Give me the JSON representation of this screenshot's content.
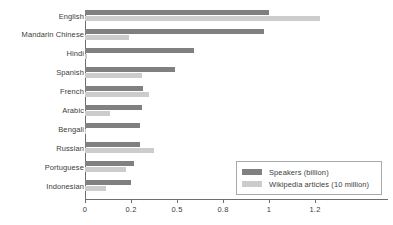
{
  "chart_data": {
    "type": "bar",
    "orientation": "horizontal",
    "title": "",
    "xlabel": "",
    "ylabel": "",
    "grid": false,
    "legend_position": "lower-right",
    "categories": [
      "English",
      "Mandarin Chinese",
      "Hindi",
      "Spanish",
      "French",
      "Arabic",
      "Bengali",
      "Russian",
      "Portuguese",
      "Indonesian"
    ],
    "xticks": [
      "0",
      "0.2",
      "0.5",
      "0.8",
      "1",
      "1.2"
    ],
    "xtick_values": [
      0,
      0.2,
      0.5,
      0.8,
      1,
      1.2
    ],
    "xlim": [
      0,
      1.4
    ],
    "series": [
      {
        "name": "Speakers (billion)",
        "color": "#808080",
        "values": [
          1.0,
          0.98,
          0.61,
          0.49,
          0.28,
          0.27,
          0.26,
          0.26,
          0.22,
          0.2
        ]
      },
      {
        "name": "Wikipedia articles (10 million)",
        "color": "#cccccc",
        "values": [
          1.22,
          0.19,
          0.008,
          0.27,
          0.32,
          0.11,
          0.006,
          0.35,
          0.18,
          0.09
        ]
      }
    ]
  },
  "legend": {
    "items": [
      {
        "label": "Speakers (billion)",
        "swatch": "speakers"
      },
      {
        "label": "Wikipedia articles (10 million)",
        "swatch": "wiki"
      }
    ]
  },
  "axis": {
    "tick_labels": [
      "0",
      "0.2",
      "0.5",
      "0.8",
      "1",
      "1.2"
    ]
  }
}
